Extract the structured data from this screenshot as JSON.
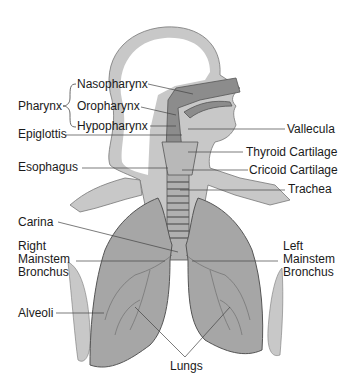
{
  "labels": {
    "pharynx": "Pharynx",
    "nasopharynx": "Nasopharynx",
    "oropharynx": "Oropharynx",
    "hypopharynx": "Hypopharynx",
    "epiglottis": "Epiglottis",
    "esophagus": "Esophagus",
    "vallecula": "Vallecula",
    "thyroid_cartilage": "Thyroid Cartilage",
    "cricoid_cartilage": "Cricoid Cartilage",
    "trachea": "Trachea",
    "carina": "Carina",
    "right_mainstem_bronchus": "Right\nMainstem\nBronchus",
    "left_mainstem_bronchus": "Left\nMainstem\nBronchus",
    "alveoli": "Alveoli",
    "lungs": "Lungs"
  },
  "colors": {
    "body": "#c8c8c8",
    "airway": "#8c8c8c",
    "lung": "#a6a6a6",
    "outline": "#555555",
    "leader": "#444444"
  }
}
